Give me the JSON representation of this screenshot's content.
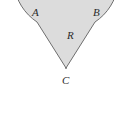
{
  "figure": {
    "name": "circular-sector-diagram",
    "background_color": "#ffffff",
    "fill_color": "#dcdcdc",
    "stroke_color": "#6e6e6e",
    "stroke_width": 1,
    "label_color": "#2b2b2b",
    "canvas": {
      "width": 129,
      "height": 130
    }
  },
  "geometry": {
    "center": {
      "x": 66,
      "y": 68
    },
    "radius": 52.5,
    "point_a": {
      "x": 37,
      "y": 22
    },
    "point_b": {
      "x": 95,
      "y": 22
    },
    "notch": "wedge A-C-B removed from disk"
  },
  "labels": {
    "a": "A",
    "b": "B",
    "r": "R",
    "c": "C"
  },
  "chart_data": {
    "type": "diagram",
    "title": "",
    "shape": "circle-with-wedge-removed",
    "annotations": [
      {
        "text": "A",
        "role": "arc-endpoint-left",
        "x": 37,
        "y": 22
      },
      {
        "text": "B",
        "role": "arc-endpoint-right",
        "x": 95,
        "y": 22
      },
      {
        "text": "R",
        "role": "radius-length",
        "x": 72,
        "y": 35
      },
      {
        "text": "C",
        "role": "center-point",
        "x": 66,
        "y": 68
      }
    ]
  }
}
